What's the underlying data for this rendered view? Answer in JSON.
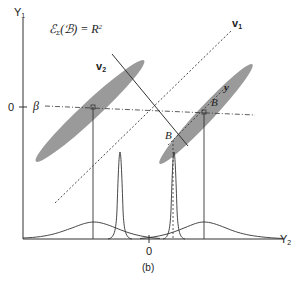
{
  "figure": {
    "caption": "(b)",
    "equation": "ℰΣ(ℬ) = R²",
    "equation_parts": {
      "lhs_main": "ℰ",
      "lhs_sub": "Σ",
      "lhs_arg": "(ℬ) = R",
      "rhs_sup": "2"
    }
  },
  "axes": {
    "y_axis": {
      "label": "Y",
      "sub": "1",
      "tick_label": "0"
    },
    "x_axis": {
      "label": "Y",
      "sub": "2",
      "tick_label": "0"
    }
  },
  "annotations": {
    "beta": "β",
    "v1": {
      "label": "v",
      "sub": "1"
    },
    "v2": {
      "label": "v",
      "sub": "2"
    },
    "B_upper": "B",
    "B_lower": "B",
    "y": "y"
  },
  "colors": {
    "ellipse_fill": "#9a9a9a",
    "line": "#333333",
    "text": "#222222"
  }
}
